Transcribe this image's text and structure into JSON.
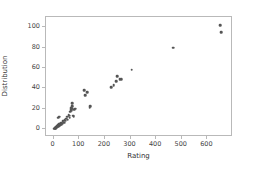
{
  "chart_data": {
    "type": "scatter",
    "title": "",
    "xlabel": "Rating",
    "ylabel": "Distribution",
    "xlim": [
      -30,
      700
    ],
    "ylim": [
      -8,
      110
    ],
    "xticks": [
      0,
      100,
      200,
      300,
      400,
      500,
      600
    ],
    "xticklabels": [
      "0",
      "100",
      "200",
      "300",
      "400",
      "500",
      "600"
    ],
    "yticks": [
      0,
      20,
      40,
      60,
      80,
      100
    ],
    "yticklabels": [
      "0",
      "20",
      "40",
      "60",
      "80",
      "100"
    ],
    "grid": false,
    "legend": false,
    "marker_color": "#555555",
    "marker_size": 2.6,
    "series": [
      {
        "name": "points",
        "points": [
          [
            3,
            0
          ],
          [
            5,
            0
          ],
          [
            6,
            1
          ],
          [
            7,
            1
          ],
          [
            8,
            0
          ],
          [
            9,
            2
          ],
          [
            10,
            1
          ],
          [
            11,
            2
          ],
          [
            12,
            1
          ],
          [
            13,
            3
          ],
          [
            14,
            2
          ],
          [
            15,
            3
          ],
          [
            16,
            2
          ],
          [
            17,
            4
          ],
          [
            18,
            3
          ],
          [
            19,
            2
          ],
          [
            20,
            4
          ],
          [
            21,
            3
          ],
          [
            22,
            5
          ],
          [
            23,
            4
          ],
          [
            24,
            3
          ],
          [
            25,
            5
          ],
          [
            26,
            4
          ],
          [
            27,
            6
          ],
          [
            28,
            5
          ],
          [
            30,
            4
          ],
          [
            31,
            6
          ],
          [
            33,
            5
          ],
          [
            18,
            11
          ],
          [
            22,
            12
          ],
          [
            35,
            7
          ],
          [
            38,
            8
          ],
          [
            40,
            6
          ],
          [
            43,
            9
          ],
          [
            46,
            8
          ],
          [
            50,
            10
          ],
          [
            52,
            12
          ],
          [
            55,
            9
          ],
          [
            58,
            14
          ],
          [
            60,
            13
          ],
          [
            62,
            11
          ],
          [
            64,
            17
          ],
          [
            66,
            19
          ],
          [
            67,
            20
          ],
          [
            68,
            18
          ],
          [
            69,
            21
          ],
          [
            70,
            19
          ],
          [
            71,
            20
          ],
          [
            72,
            22
          ],
          [
            73,
            25
          ],
          [
            75,
            20
          ],
          [
            76,
            13
          ],
          [
            78,
            12
          ],
          [
            80,
            19
          ],
          [
            84,
            20
          ],
          [
            120,
            38
          ],
          [
            124,
            33
          ],
          [
            131,
            36
          ],
          [
            140,
            21
          ],
          [
            142,
            22
          ],
          [
            225,
            41
          ],
          [
            235,
            43
          ],
          [
            244,
            47
          ],
          [
            248,
            52
          ],
          [
            258,
            49
          ],
          [
            264,
            49
          ],
          [
            305,
            58
          ],
          [
            467,
            80
          ],
          [
            650,
            102
          ],
          [
            653,
            95
          ]
        ]
      }
    ]
  }
}
